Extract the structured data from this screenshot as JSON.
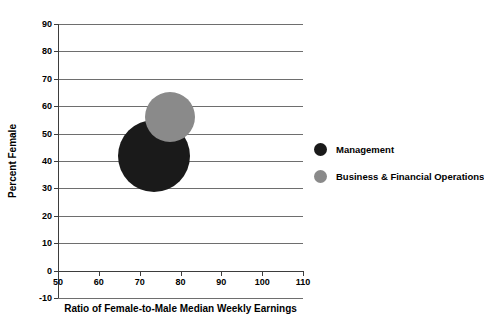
{
  "chart_data": {
    "type": "scatter",
    "title": "",
    "xlabel": "Ratio of Female-to-Male Median Weekly Earnings",
    "ylabel": "Percent Female",
    "xlim": [
      50,
      110
    ],
    "ylim": [
      -10,
      90
    ],
    "xticks": [
      50,
      60,
      70,
      80,
      90,
      100,
      110
    ],
    "yticks": [
      -10,
      0,
      10,
      20,
      30,
      40,
      50,
      60,
      70,
      80,
      90
    ],
    "grid": true,
    "legend_position": "right",
    "series": [
      {
        "name": "Management",
        "color": "#1a1a1a",
        "x": 73.5,
        "y": 42,
        "size_px": 72
      },
      {
        "name": "Business & Financial Operations",
        "color": "#8a8a8a",
        "x": 77.5,
        "y": 56,
        "size_px": 50
      }
    ]
  },
  "axis": {
    "x_title": "Ratio of Female-to-Male Median Weekly Earnings",
    "y_title": "Percent Female",
    "x_tick_labels": [
      "50",
      "60",
      "70",
      "80",
      "90",
      "100",
      "110"
    ],
    "y_tick_labels": [
      "90",
      "80",
      "70",
      "60",
      "50",
      "40",
      "30",
      "20",
      "10",
      "0",
      "-10"
    ]
  },
  "legend": {
    "items": [
      {
        "label": "Management",
        "color": "#1a1a1a"
      },
      {
        "label": "Business & Financial Operations",
        "color": "#8a8a8a"
      }
    ]
  },
  "colors": {
    "gridline": "#6e6e6e",
    "axis": "#3d3d3d",
    "background": "#ffffff",
    "text": "#000000"
  }
}
